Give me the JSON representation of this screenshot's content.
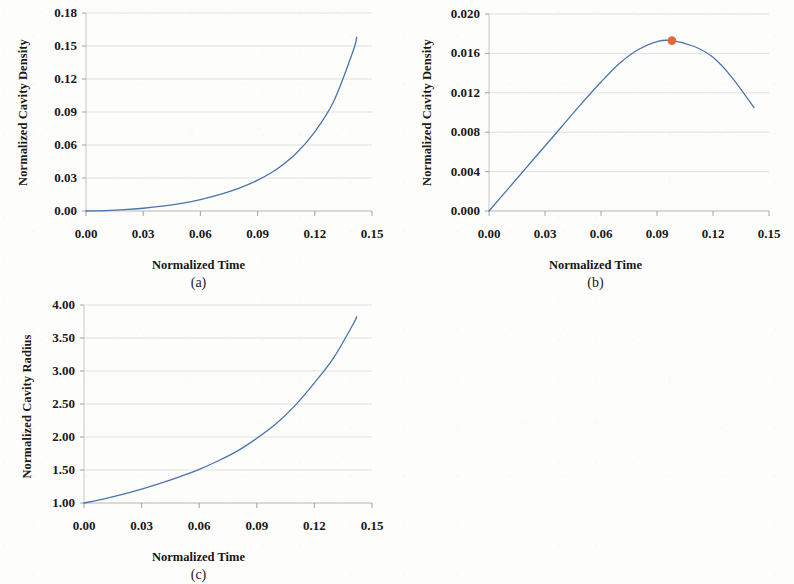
{
  "figure": {
    "background_color": "#fdfdfc",
    "line_color": "#4a74ab",
    "marker_color": "#e4673a",
    "grid_color": "#d9d9d9",
    "axis_color": "#bfbfbf"
  },
  "panels": [
    {
      "tag": "(a)",
      "xlabel": "Normalized Time",
      "ylabel": "Normalized Cavity Density",
      "xticks": [
        "0.00",
        "0.03",
        "0.06",
        "0.09",
        "0.12",
        "0.15"
      ],
      "yticks": [
        "0.00",
        "0.03",
        "0.06",
        "0.09",
        "0.12",
        "0.15",
        "0.18"
      ]
    },
    {
      "tag": "(b)",
      "xlabel": "Normalized Time",
      "ylabel": "Normalized Cavity Density",
      "xticks": [
        "0.00",
        "0.03",
        "0.06",
        "0.09",
        "0.12",
        "0.15"
      ],
      "yticks": [
        "0.000",
        "0.004",
        "0.008",
        "0.012",
        "0.016",
        "0.020"
      ]
    },
    {
      "tag": "(c)",
      "xlabel": "Normalized Time",
      "ylabel": "Normalized Cavity Radius",
      "xticks": [
        "0.00",
        "0.03",
        "0.06",
        "0.09",
        "0.12",
        "0.15"
      ],
      "yticks": [
        "1.00",
        "1.50",
        "2.00",
        "2.50",
        "3.00",
        "3.50",
        "4.00"
      ]
    }
  ],
  "chart_data": [
    {
      "type": "line",
      "panel": "(a)",
      "title": "",
      "xlabel": "Normalized Time",
      "ylabel": "Normalized Cavity Density",
      "xlim": [
        0.0,
        0.15
      ],
      "ylim": [
        0.0,
        0.18
      ],
      "xticks": [
        0.0,
        0.03,
        0.06,
        0.09,
        0.12,
        0.15
      ],
      "yticks": [
        0.0,
        0.03,
        0.06,
        0.09,
        0.12,
        0.15,
        0.18
      ],
      "grid": "horizontal",
      "legend": "none",
      "series": [
        {
          "name": "normalized cavity density",
          "color": "#4a74ab",
          "x": [
            0.0,
            0.01,
            0.02,
            0.03,
            0.04,
            0.05,
            0.06,
            0.07,
            0.08,
            0.09,
            0.1,
            0.11,
            0.12,
            0.13,
            0.14,
            0.142
          ],
          "y": [
            0.0,
            0.0004,
            0.0012,
            0.0025,
            0.0044,
            0.007,
            0.0104,
            0.0148,
            0.0205,
            0.028,
            0.038,
            0.052,
            0.072,
            0.1,
            0.145,
            0.158
          ]
        }
      ]
    },
    {
      "type": "line",
      "panel": "(b)",
      "title": "",
      "xlabel": "Normalized Time",
      "ylabel": "Normalized Cavity Density",
      "xlim": [
        0.0,
        0.15
      ],
      "ylim": [
        0.0,
        0.02
      ],
      "xticks": [
        0.0,
        0.03,
        0.06,
        0.09,
        0.12,
        0.15
      ],
      "yticks": [
        0.0,
        0.004,
        0.008,
        0.012,
        0.016,
        0.02
      ],
      "grid": "horizontal",
      "legend": "none",
      "series": [
        {
          "name": "normalized cavity density",
          "color": "#4a74ab",
          "x": [
            0.0,
            0.01,
            0.02,
            0.03,
            0.04,
            0.05,
            0.06,
            0.07,
            0.08,
            0.09,
            0.098,
            0.11,
            0.12,
            0.13,
            0.142
          ],
          "y": [
            0.0,
            0.0022,
            0.0044,
            0.0066,
            0.0088,
            0.011,
            0.0131,
            0.015,
            0.0164,
            0.0172,
            0.0173,
            0.0167,
            0.0156,
            0.0136,
            0.0105
          ]
        }
      ],
      "annotations": [
        {
          "name": "peak-marker",
          "type": "point",
          "x": 0.098,
          "y": 0.0173,
          "color": "#e4673a"
        }
      ]
    },
    {
      "type": "line",
      "panel": "(c)",
      "title": "",
      "xlabel": "Normalized Time",
      "ylabel": "Normalized Cavity Radius",
      "xlim": [
        0.0,
        0.15
      ],
      "ylim": [
        1.0,
        4.0
      ],
      "xticks": [
        0.0,
        0.03,
        0.06,
        0.09,
        0.12,
        0.15
      ],
      "yticks": [
        1.0,
        1.5,
        2.0,
        2.5,
        3.0,
        3.5,
        4.0
      ],
      "grid": "horizontal",
      "legend": "none",
      "series": [
        {
          "name": "normalized cavity radius",
          "color": "#4a74ab",
          "x": [
            0.0,
            0.01,
            0.02,
            0.03,
            0.04,
            0.05,
            0.06,
            0.07,
            0.08,
            0.09,
            0.1,
            0.11,
            0.12,
            0.13,
            0.14,
            0.142
          ],
          "y": [
            1.0,
            1.06,
            1.13,
            1.21,
            1.3,
            1.4,
            1.51,
            1.64,
            1.79,
            1.98,
            2.2,
            2.48,
            2.82,
            3.2,
            3.7,
            3.82
          ]
        }
      ]
    }
  ]
}
